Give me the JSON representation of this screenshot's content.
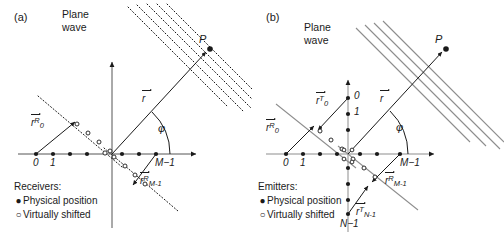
{
  "figure": {
    "width": 504,
    "height": 238,
    "background": "#ffffff",
    "ink": "#1a1a1a",
    "gray": "#8d8d8d"
  },
  "panels": [
    {
      "id": "a",
      "tag": "(a)",
      "plane_wave_label": "Plane\nwave",
      "plane_wave_line1": "Plane",
      "plane_wave_line2": "wave",
      "plane_wave_style": "dotted",
      "plane_wave_color": "#1a1a1a",
      "plane_wave_count": 5,
      "point_label": "P",
      "angle_label": "φ",
      "direction_vector_label": "r",
      "axis_labels": {
        "origin": "0",
        "first": "1",
        "last": "M−1"
      },
      "vectors": [
        {
          "name": "r_0_R",
          "base": "r",
          "sup": "R",
          "sub": "0"
        },
        {
          "name": "r_Mminus1_R",
          "base": "r",
          "sup": "R",
          "sub": "M-1"
        }
      ],
      "legend": {
        "title": "Receivers:",
        "items": [
          {
            "symbol": "●",
            "label": "Physical position",
            "filled": true
          },
          {
            "symbol": "○",
            "label": "Virtually shifted",
            "filled": false
          }
        ]
      },
      "array_dot_count": 8,
      "shifted_dot_count": 5
    },
    {
      "id": "b",
      "tag": "(b)",
      "plane_wave_label": "Plane\nwave",
      "plane_wave_line1": "Plane",
      "plane_wave_line2": "wave",
      "plane_wave_style": "solid",
      "plane_wave_color": "#8d8d8d",
      "plane_wave_count": 4,
      "point_label": "P",
      "angle_label": "φ",
      "direction_vector_label": "r",
      "axis_labels": {
        "origin": "0",
        "first": "1",
        "last": "M−1",
        "y_origin": "0",
        "y_first": "1",
        "y_last": "N−1"
      },
      "vectors": [
        {
          "name": "r_0_T",
          "base": "r",
          "sup": "T",
          "sub": "0"
        },
        {
          "name": "r_0_R",
          "base": "r",
          "sup": "R",
          "sub": "0"
        },
        {
          "name": "r_Mminus1_R",
          "base": "r",
          "sup": "R",
          "sub": "M-1"
        },
        {
          "name": "r_Nminus1_T",
          "base": "r",
          "sup": "T",
          "sub": "N-1"
        }
      ],
      "legend": {
        "title": "Emitters:",
        "items": [
          {
            "symbol": "●",
            "label": "Physical position",
            "filled": true
          },
          {
            "symbol": "○",
            "label": "Virtually shifted",
            "filled": false
          }
        ]
      },
      "array_dot_count": 8,
      "y_dot_count": 8
    }
  ]
}
